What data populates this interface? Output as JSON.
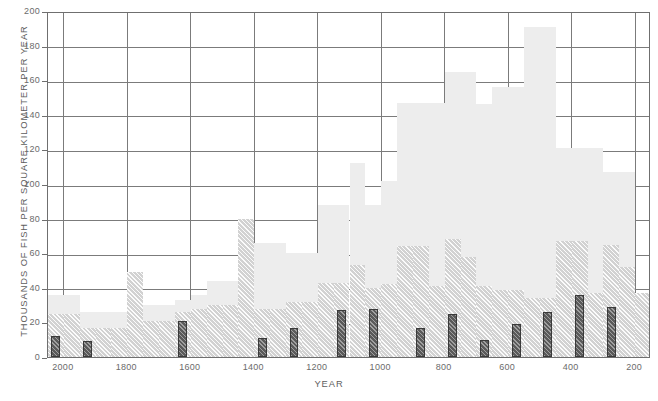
{
  "chart_data": {
    "type": "bar",
    "title": "",
    "xlabel": "YEAR",
    "ylabel": "THOUSANDS OF FISH PER SQUARE KILOMETER PER YEAR",
    "ylim": [
      0,
      200
    ],
    "yticks": [
      0,
      20,
      40,
      60,
      80,
      100,
      120,
      140,
      160,
      180,
      200
    ],
    "xlim": [
      2050,
      150
    ],
    "xticks": [
      2000,
      1800,
      1600,
      1400,
      1200,
      1000,
      800,
      600,
      400,
      200
    ],
    "x_axis_reversed": true,
    "grid": true,
    "legend_position": "none",
    "bin_width_years": 50,
    "x_bin_starts": [
      2050,
      2000,
      1950,
      1900,
      1850,
      1800,
      1750,
      1700,
      1650,
      1600,
      1550,
      1500,
      1450,
      1400,
      1350,
      1300,
      1250,
      1200,
      1150,
      1100,
      1050,
      1000,
      950,
      900,
      850,
      800,
      750,
      700,
      650,
      600,
      550,
      500,
      450,
      400,
      350,
      300,
      250,
      200
    ],
    "series": [
      {
        "name": "total",
        "style": "solid-light-gray",
        "color": "#ededed",
        "values": [
          36,
          36,
          26,
          26,
          26,
          49,
          30,
          30,
          33,
          36,
          44,
          44,
          80,
          66,
          66,
          60,
          60,
          88,
          88,
          112,
          88,
          102,
          147,
          147,
          147,
          165,
          165,
          146,
          156,
          156,
          191,
          191,
          121,
          121,
          121,
          107,
          107,
          37
        ]
      },
      {
        "name": "middle",
        "style": "hatched-light-gray",
        "color": "#d2d2d2",
        "values": [
          25,
          25,
          17,
          17,
          17,
          49,
          21,
          21,
          26,
          28,
          30,
          30,
          80,
          28,
          28,
          32,
          32,
          43,
          43,
          53,
          40,
          42,
          64,
          64,
          41,
          68,
          58,
          41,
          39,
          39,
          34,
          34,
          67,
          67,
          37,
          65,
          52,
          37
        ]
      },
      {
        "name": "front",
        "style": "hatched-dark-gray",
        "color": "#5a5a5a",
        "values": [
          12,
          0,
          9,
          0,
          0,
          0,
          0,
          0,
          21,
          0,
          0,
          0,
          0,
          11,
          0,
          17,
          0,
          0,
          27,
          0,
          28,
          0,
          0,
          17,
          0,
          25,
          0,
          10,
          0,
          19,
          0,
          26,
          0,
          36,
          0,
          29,
          0,
          0
        ]
      }
    ]
  },
  "axes": {
    "ytick_labels": [
      "200",
      "180",
      "160",
      "140",
      "120",
      "100",
      "80",
      "60",
      "40",
      "20",
      "0"
    ],
    "xtick_labels": [
      "2000",
      "1800",
      "1600",
      "1400",
      "1200",
      "1000",
      "800",
      "600",
      "400",
      "200"
    ]
  }
}
